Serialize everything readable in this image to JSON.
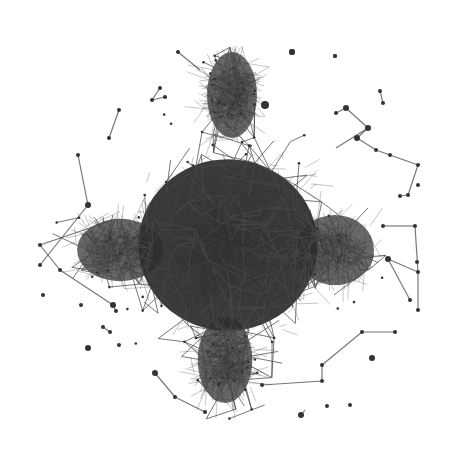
{
  "figure": {
    "type": "network-graph",
    "layout": "force-directed",
    "background": "#ffffff",
    "edge_color": "#4a4a4a",
    "node_color": "#333333",
    "core_color": "#2a2a2a",
    "canvas": {
      "width": 453,
      "height": 454
    }
  },
  "core": {
    "description": "dense central cluster in diamond shape",
    "center": [
      227,
      250
    ],
    "lobes": [
      {
        "name": "top",
        "cx": 232,
        "cy": 95,
        "rx": 32,
        "ry": 55
      },
      {
        "name": "bottom",
        "cx": 225,
        "cy": 360,
        "rx": 35,
        "ry": 55
      },
      {
        "name": "left",
        "cx": 120,
        "cy": 250,
        "rx": 55,
        "ry": 40
      },
      {
        "name": "right",
        "cx": 335,
        "cy": 250,
        "rx": 50,
        "ry": 45
      },
      {
        "name": "center",
        "cx": 228,
        "cy": 245,
        "rx": 115,
        "ry": 110
      }
    ]
  },
  "peripheral_nodes": [
    [
      292,
      52,
      3
    ],
    [
      335,
      56,
      2
    ],
    [
      380,
      91,
      2
    ],
    [
      383,
      103,
      2
    ],
    [
      346,
      108,
      3
    ],
    [
      336,
      113,
      2
    ],
    [
      368,
      128,
      3
    ],
    [
      357,
      138,
      3
    ],
    [
      376,
      150,
      2
    ],
    [
      390,
      155,
      2
    ],
    [
      418,
      165,
      2
    ],
    [
      408,
      195,
      2
    ],
    [
      418,
      185,
      2
    ],
    [
      400,
      196,
      2
    ],
    [
      383,
      226,
      2
    ],
    [
      415,
      226,
      2
    ],
    [
      388,
      259,
      3
    ],
    [
      418,
      272,
      2
    ],
    [
      418,
      310,
      2
    ],
    [
      362,
      332,
      2
    ],
    [
      322,
      365,
      2
    ],
    [
      372,
      358,
      3
    ],
    [
      327,
      406,
      2
    ],
    [
      301,
      415,
      3
    ],
    [
      119,
      110,
      2
    ],
    [
      109,
      138,
      2
    ],
    [
      78,
      155,
      2
    ],
    [
      88,
      205,
      3
    ],
    [
      43,
      295,
      2
    ],
    [
      81,
      305,
      2
    ],
    [
      88,
      348,
      3
    ],
    [
      119,
      345,
      2
    ],
    [
      103,
      327,
      2
    ],
    [
      110,
      332,
      2
    ],
    [
      155,
      373,
      3
    ],
    [
      175,
      397,
      2
    ],
    [
      205,
      412,
      2
    ],
    [
      262,
      385,
      2
    ],
    [
      322,
      381,
      2
    ],
    [
      40,
      245,
      2
    ],
    [
      40,
      265,
      2
    ],
    [
      60,
      270,
      2
    ],
    [
      113,
      305,
      3
    ],
    [
      116,
      311,
      2
    ],
    [
      160,
      88,
      2
    ],
    [
      152,
      100,
      2
    ],
    [
      165,
      97,
      2
    ],
    [
      265,
      105,
      4
    ],
    [
      417,
      262,
      2
    ],
    [
      410,
      300,
      2
    ],
    [
      395,
      332,
      2
    ],
    [
      178,
      52,
      2
    ],
    [
      350,
      405,
      2
    ]
  ],
  "peripheral_edges": [
    [
      [
        380,
        91
      ],
      [
        383,
        103
      ]
    ],
    [
      [
        346,
        108
      ],
      [
        336,
        113
      ]
    ],
    [
      [
        346,
        108
      ],
      [
        368,
        128
      ]
    ],
    [
      [
        368,
        128
      ],
      [
        357,
        138
      ]
    ],
    [
      [
        357,
        138
      ],
      [
        376,
        150
      ]
    ],
    [
      [
        376,
        150
      ],
      [
        418,
        165
      ]
    ],
    [
      [
        418,
        165
      ],
      [
        408,
        195
      ]
    ],
    [
      [
        408,
        195
      ],
      [
        400,
        196
      ]
    ],
    [
      [
        383,
        103
      ],
      [
        383,
        103
      ]
    ],
    [
      [
        119,
        110
      ],
      [
        109,
        138
      ]
    ],
    [
      [
        78,
        155
      ],
      [
        88,
        205
      ]
    ],
    [
      [
        103,
        327
      ],
      [
        110,
        332
      ]
    ],
    [
      [
        301,
        415
      ],
      [
        305,
        410
      ]
    ],
    [
      [
        322,
        365
      ],
      [
        362,
        332
      ]
    ],
    [
      [
        362,
        332
      ],
      [
        395,
        332
      ]
    ],
    [
      [
        322,
        365
      ],
      [
        322,
        381
      ]
    ],
    [
      [
        322,
        381
      ],
      [
        262,
        385
      ]
    ],
    [
      [
        155,
        373
      ],
      [
        175,
        397
      ]
    ],
    [
      [
        175,
        397
      ],
      [
        205,
        412
      ]
    ],
    [
      [
        40,
        245
      ],
      [
        60,
        270
      ]
    ],
    [
      [
        40,
        265
      ],
      [
        88,
        205
      ]
    ],
    [
      [
        40,
        245
      ],
      [
        113,
        220
      ]
    ],
    [
      [
        60,
        270
      ],
      [
        113,
        305
      ]
    ],
    [
      [
        113,
        305
      ],
      [
        116,
        311
      ]
    ],
    [
      [
        383,
        226
      ],
      [
        415,
        226
      ]
    ],
    [
      [
        415,
        226
      ],
      [
        418,
        272
      ]
    ],
    [
      [
        388,
        259
      ],
      [
        418,
        272
      ]
    ],
    [
      [
        418,
        272
      ],
      [
        418,
        310
      ]
    ],
    [
      [
        388,
        259
      ],
      [
        410,
        300
      ]
    ],
    [
      [
        368,
        128
      ],
      [
        336,
        148
      ]
    ],
    [
      [
        160,
        88
      ],
      [
        152,
        100
      ]
    ],
    [
      [
        152,
        100
      ],
      [
        165,
        97
      ]
    ],
    [
      [
        178,
        52
      ],
      [
        200,
        70
      ]
    ]
  ],
  "isolated_nodes": [
    [
      335,
      56,
      2
    ],
    [
      292,
      52,
      3
    ],
    [
      43,
      295,
      2
    ],
    [
      81,
      305,
      2
    ],
    [
      88,
      348,
      3
    ],
    [
      119,
      345,
      2
    ],
    [
      372,
      358,
      3
    ],
    [
      327,
      406,
      2
    ],
    [
      301,
      415,
      3
    ]
  ],
  "generator": {
    "core_edges": 2600,
    "mesh_edges": 700,
    "seed": 17
  }
}
